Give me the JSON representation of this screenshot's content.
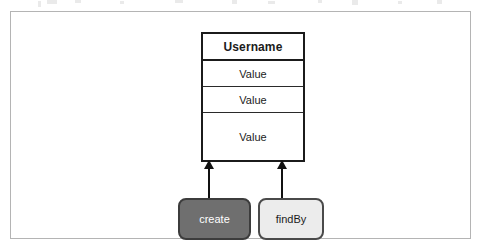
{
  "figure": {
    "kind": "uml-entity-with-operations",
    "frame": {
      "border_color": "#b4b4b4",
      "background": "#ffffff"
    }
  },
  "entity": {
    "header_label": "Username",
    "rows": [
      {
        "label": "Value"
      },
      {
        "label": "Value"
      },
      {
        "label": "Value"
      }
    ],
    "border_color": "#1b1b1b",
    "background": "#ffffff"
  },
  "arrows": [
    {
      "name": "create-to-entity",
      "direction": "up"
    },
    {
      "name": "findby-to-entity",
      "direction": "up"
    }
  ],
  "methods": [
    {
      "label": "create",
      "fill": "#6f6f6f",
      "text_color": "#ffffff",
      "border_color": "#3c3c3c"
    },
    {
      "label": "findBy",
      "fill": "#ececec",
      "text_color": "#1b1b1b",
      "border_color": "#4a4a4a"
    }
  ]
}
